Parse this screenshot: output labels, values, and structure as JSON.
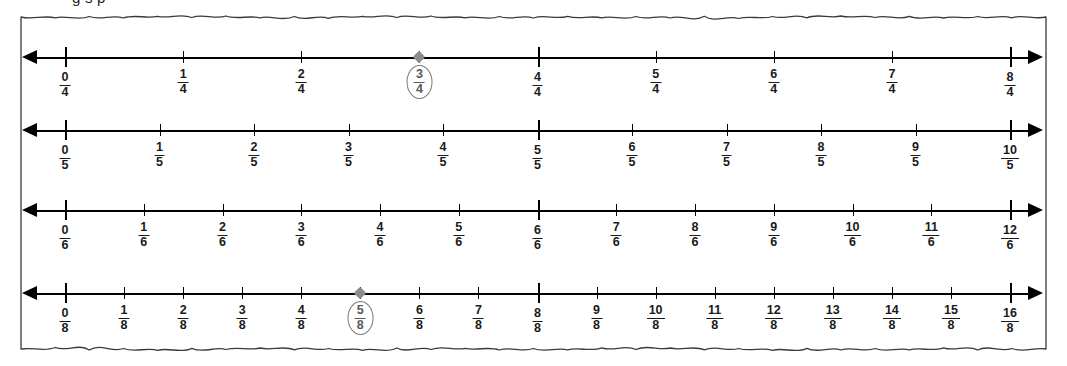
{
  "heading": {
    "clipped_text": "g   s          p"
  },
  "paper": {
    "edge_style": "torn",
    "border_color": "#3a3a3a",
    "background": "#ffffff"
  },
  "marker": {
    "circle_color": "#7b7b7e",
    "dot_color": "#8d8d90",
    "label_color": "#58585a"
  },
  "chart_data": {
    "type": "line",
    "title": "",
    "subtitle": "",
    "xlabel": "",
    "ylabel": "",
    "axis_range": [
      0,
      2
    ],
    "grid": false,
    "legend": "none",
    "number_lines": [
      {
        "id": "fourths",
        "denominator": 4,
        "y": 57,
        "arrows": [
          "left",
          "right"
        ],
        "labels": [
          "0/4",
          "1/4",
          "2/4",
          "3/4",
          "4/4",
          "5/4",
          "6/4",
          "7/4",
          "8/4"
        ],
        "numerators": [
          0,
          1,
          2,
          3,
          4,
          5,
          6,
          7,
          8
        ],
        "values": [
          0,
          0.25,
          0.5,
          0.75,
          1,
          1.25,
          1.5,
          1.75,
          2
        ],
        "major_ticks": [
          0,
          4,
          8
        ],
        "highlighted": 3
      },
      {
        "id": "fifths",
        "denominator": 5,
        "y": 130,
        "arrows": [
          "left",
          "right"
        ],
        "labels": [
          "0/5",
          "1/5",
          "2/5",
          "3/5",
          "4/5",
          "5/5",
          "6/5",
          "7/5",
          "8/5",
          "9/5",
          "10/5"
        ],
        "numerators": [
          0,
          1,
          2,
          3,
          4,
          5,
          6,
          7,
          8,
          9,
          10
        ],
        "values": [
          0,
          0.2,
          0.4,
          0.6,
          0.8,
          1,
          1.2,
          1.4,
          1.6,
          1.8,
          2
        ],
        "major_ticks": [
          0,
          5,
          10
        ],
        "highlighted": null
      },
      {
        "id": "sixths",
        "denominator": 6,
        "y": 210,
        "arrows": [
          "left",
          "right"
        ],
        "labels": [
          "0/6",
          "1/6",
          "2/6",
          "3/6",
          "4/6",
          "5/6",
          "6/6",
          "7/6",
          "8/6",
          "9/6",
          "10/6",
          "11/6",
          "12/6"
        ],
        "numerators": [
          0,
          1,
          2,
          3,
          4,
          5,
          6,
          7,
          8,
          9,
          10,
          11,
          12
        ],
        "values": [
          0,
          0.1667,
          0.3333,
          0.5,
          0.6667,
          0.8333,
          1,
          1.1667,
          1.3333,
          1.5,
          1.6667,
          1.8333,
          2
        ],
        "major_ticks": [
          0,
          6,
          12
        ],
        "highlighted": null
      },
      {
        "id": "eighths",
        "denominator": 8,
        "y": 293,
        "arrows": [
          "left",
          "right"
        ],
        "labels": [
          "0/8",
          "1/8",
          "2/8",
          "3/8",
          "4/8",
          "5/8",
          "6/8",
          "7/8",
          "8/8",
          "9/8",
          "10/8",
          "11/8",
          "12/8",
          "13/8",
          "14/8",
          "15/8",
          "16/8"
        ],
        "numerators": [
          0,
          1,
          2,
          3,
          4,
          5,
          6,
          7,
          8,
          9,
          10,
          11,
          12,
          13,
          14,
          15,
          16
        ],
        "values": [
          0,
          0.125,
          0.25,
          0.375,
          0.5,
          0.625,
          0.75,
          0.875,
          1,
          1.125,
          1.25,
          1.375,
          1.5,
          1.625,
          1.75,
          1.875,
          2
        ],
        "major_ticks": [
          0,
          8,
          16
        ],
        "highlighted": 5
      }
    ],
    "equivalence_highlight": {
      "note": "3/4 and 5/8 are circled",
      "points": [
        "3/4",
        "5/8"
      ]
    }
  },
  "geometry": {
    "x_start": 65,
    "x_end": 1010
  }
}
